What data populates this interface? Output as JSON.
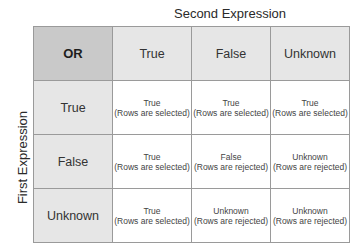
{
  "labels": {
    "column_axis": "Second Expression",
    "row_axis": "First Expression",
    "operator": "OR"
  },
  "columns": [
    "True",
    "False",
    "Unknown"
  ],
  "rows": [
    {
      "label": "True",
      "cells": [
        {
          "value": "True",
          "note": "(Rows are selected)"
        },
        {
          "value": "True",
          "note": "(Rows are selected)"
        },
        {
          "value": "True",
          "note": "(Rows are selected)"
        }
      ]
    },
    {
      "label": "False",
      "cells": [
        {
          "value": "True",
          "note": "(Rows are selected)"
        },
        {
          "value": "False",
          "note": "(Rows are rejected)"
        },
        {
          "value": "Unknown",
          "note": "(Rows are rejected)"
        }
      ]
    },
    {
      "label": "Unknown",
      "cells": [
        {
          "value": "True",
          "note": "(Rows are selected)"
        },
        {
          "value": "Unknown",
          "note": "(Rows are rejected)"
        },
        {
          "value": "Unknown",
          "note": "(Rows are rejected)"
        }
      ]
    }
  ],
  "colors": {
    "corner_bg": "#c9c9c9",
    "header_bg": "#e6e6e6",
    "cell_bg": "#ffffff",
    "border": "#9a9a9a"
  }
}
